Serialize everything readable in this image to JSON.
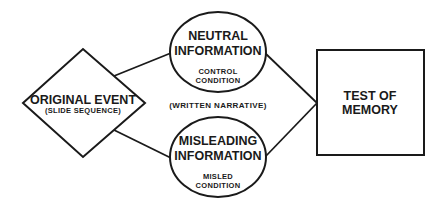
{
  "diagram": {
    "nodes": {
      "original_event": {
        "shape": "diamond",
        "title": "ORIGINAL EVENT",
        "subtitle": "(SLIDE SEQUENCE)"
      },
      "neutral_information": {
        "shape": "ellipse",
        "title_line1": "NEUTRAL",
        "title_line2": "INFORMATION",
        "sub_line1": "CONTROL",
        "sub_line2": "CONDITION"
      },
      "misleading_information": {
        "shape": "ellipse",
        "title_line1": "MISLEADING",
        "title_line2": "INFORMATION",
        "sub_line1": "MISLED",
        "sub_line2": "CONDITION"
      },
      "test_of_memory": {
        "shape": "square",
        "title_line1": "TEST OF",
        "title_line2": "MEMORY"
      }
    },
    "middle_label": "(WRITTEN NARRATIVE)",
    "edges": [
      {
        "from": "original_event",
        "to": "neutral_information"
      },
      {
        "from": "original_event",
        "to": "misleading_information"
      },
      {
        "from": "neutral_information",
        "to": "test_of_memory"
      },
      {
        "from": "misleading_information",
        "to": "test_of_memory"
      }
    ],
    "colors": {
      "stroke": "#1a1a1a",
      "background": "#ffffff"
    }
  }
}
